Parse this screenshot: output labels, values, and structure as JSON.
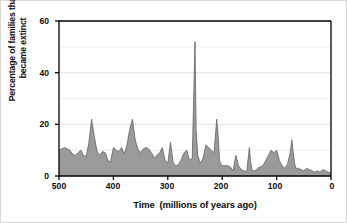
{
  "chart_data": {
    "type": "area",
    "title": "",
    "xlabel": "Time  (millions of years ago)",
    "ylabel_line1": "Percentage of families that",
    "ylabel_line2": "became extinct",
    "ylabel": "Percentage of families that became extinct",
    "xlim": [
      500,
      0
    ],
    "ylim": [
      0,
      60
    ],
    "x_reversed": true,
    "grid": "horizontal",
    "legend": "none",
    "fill_color": "#9a9a9a",
    "line_color": "#6d6d6d",
    "axis_color": "#000000",
    "gridline_color": "#e2e2e2",
    "background_color": "#ffffff",
    "xticks": [
      500,
      400,
      300,
      200,
      100,
      0
    ],
    "xtick_labels": [
      "500",
      "400",
      "300",
      "200",
      "100",
      "0"
    ],
    "yticks": [
      0,
      20,
      40,
      60
    ],
    "ytick_labels": [
      "0",
      "20",
      "40",
      "60"
    ],
    "series_name": "Percentage of families that became extinct",
    "x": [
      500,
      495,
      490,
      485,
      480,
      475,
      470,
      465,
      460,
      455,
      450,
      445,
      440,
      435,
      430,
      425,
      420,
      415,
      410,
      405,
      400,
      395,
      390,
      385,
      380,
      375,
      370,
      365,
      360,
      355,
      350,
      345,
      340,
      335,
      330,
      325,
      320,
      315,
      310,
      305,
      300,
      295,
      290,
      285,
      280,
      275,
      270,
      265,
      260,
      255,
      250,
      248,
      245,
      242,
      240,
      235,
      230,
      225,
      220,
      215,
      210,
      207,
      205,
      202,
      200,
      195,
      190,
      185,
      180,
      175,
      170,
      165,
      160,
      155,
      150,
      148,
      145,
      140,
      135,
      130,
      125,
      120,
      115,
      110,
      105,
      100,
      95,
      90,
      85,
      80,
      75,
      72,
      70,
      67,
      65,
      60,
      55,
      50,
      45,
      40,
      35,
      30,
      25,
      20,
      15,
      10,
      5,
      0
    ],
    "y": [
      10,
      10.5,
      11,
      10.5,
      10,
      8.5,
      8,
      9,
      10,
      8,
      7.5,
      13,
      22,
      15,
      9.5,
      8,
      9.5,
      9,
      6,
      5.5,
      11,
      10,
      9.5,
      11,
      8.5,
      12,
      18,
      22,
      14,
      10.5,
      9,
      10.5,
      11,
      10.5,
      9,
      7,
      8,
      9,
      11,
      6,
      5,
      13,
      5,
      4,
      4.5,
      6.5,
      9,
      10,
      6,
      7,
      52,
      18,
      8,
      6,
      5,
      7,
      12,
      11,
      10,
      9,
      22,
      14,
      6,
      4.5,
      4,
      4,
      4,
      3.5,
      2,
      8,
      4,
      2.5,
      2,
      1.5,
      11,
      6,
      2,
      2,
      3,
      3.5,
      4,
      6,
      8,
      10,
      9,
      10,
      6,
      4,
      3,
      4.5,
      9,
      14,
      10,
      5,
      3,
      3,
      2.5,
      2,
      3,
      2.5,
      2,
      1.5,
      2,
      1.5,
      2.5,
      2,
      1.5,
      1,
      1
    ]
  },
  "axes": {
    "y_ticks": [
      {
        "label": "60",
        "value": 60
      },
      {
        "label": "40",
        "value": 40
      },
      {
        "label": "20",
        "value": 20
      },
      {
        "label": "0",
        "value": 0
      }
    ],
    "x_ticks": [
      {
        "label": "500",
        "value": 500
      },
      {
        "label": "400",
        "value": 400
      },
      {
        "label": "300",
        "value": 300
      },
      {
        "label": "200",
        "value": 200
      },
      {
        "label": "100",
        "value": 100
      },
      {
        "label": "0",
        "value": 0
      }
    ]
  },
  "labels": {
    "x_axis_title": "Time  (millions of years ago)",
    "y_axis_title_line1": "Percentage of families that",
    "y_axis_title_line2": "became extinct"
  }
}
